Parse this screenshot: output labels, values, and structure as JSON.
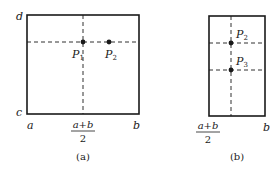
{
  "panels": [
    {
      "id": "a",
      "caption": "(a)",
      "corner_labels": {
        "top_left": "d",
        "bottom_left": "c"
      },
      "x_labels": {
        "left": "a",
        "mid_num": "a+b",
        "mid_den": "2",
        "right": "b"
      },
      "points": [
        {
          "name": "P",
          "sub": "1"
        },
        {
          "name": "P",
          "sub": "2"
        }
      ]
    },
    {
      "id": "b",
      "caption": "(b)",
      "x_labels": {
        "mid_num": "a+b",
        "mid_den": "2",
        "right": "b"
      },
      "points": [
        {
          "name": "P",
          "sub": "2"
        },
        {
          "name": "P",
          "sub": "3"
        }
      ]
    }
  ]
}
